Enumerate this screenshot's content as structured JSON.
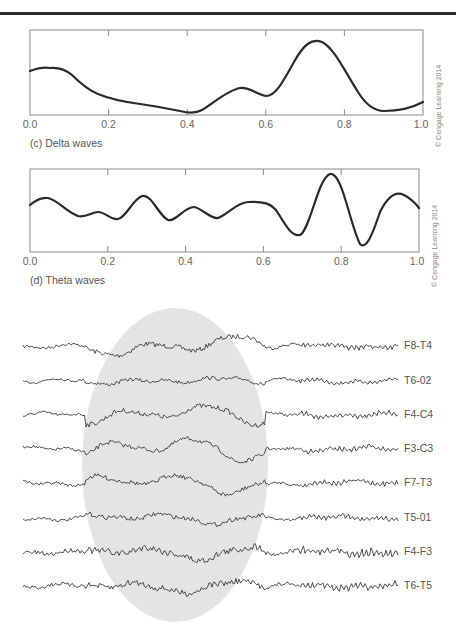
{
  "chart_data": [
    {
      "type": "line",
      "title": "",
      "caption": "(c) Delta waves",
      "xlabel": "",
      "ylabel": "",
      "xlim": [
        0.0,
        1.0
      ],
      "xticks": [
        "0.0",
        "0.2",
        "0.4",
        "0.6",
        "0.8",
        "1.0"
      ],
      "grid": false,
      "credit": "© Cengage Learning 2014",
      "series": [
        {
          "name": "Delta wave",
          "x": [
            0.0,
            0.05,
            0.1,
            0.15,
            0.2,
            0.25,
            0.3,
            0.35,
            0.4,
            0.45,
            0.5,
            0.55,
            0.6,
            0.65,
            0.7,
            0.74,
            0.78,
            0.82,
            0.86,
            0.9,
            0.95,
            1.0
          ],
          "values": [
            0.62,
            0.65,
            0.58,
            0.38,
            0.28,
            0.21,
            0.18,
            0.12,
            0.04,
            0.09,
            0.3,
            0.42,
            0.3,
            0.47,
            0.86,
            0.98,
            0.78,
            0.42,
            0.12,
            0.07,
            0.09,
            0.19
          ]
        }
      ]
    },
    {
      "type": "line",
      "title": "",
      "caption": "(d) Theta waves",
      "xlabel": "",
      "ylabel": "",
      "xlim": [
        0.0,
        1.0
      ],
      "xticks": [
        "0.0",
        "0.2",
        "0.4",
        "0.6",
        "0.8",
        "1.0"
      ],
      "grid": false,
      "credit": "© Cengage Learning 2014",
      "series": [
        {
          "name": "Theta wave",
          "x": [
            0.0,
            0.04,
            0.08,
            0.13,
            0.17,
            0.22,
            0.26,
            0.29,
            0.32,
            0.36,
            0.39,
            0.43,
            0.46,
            0.49,
            0.53,
            0.57,
            0.62,
            0.66,
            0.7,
            0.74,
            0.78,
            0.82,
            0.87,
            0.91,
            0.95,
            1.0
          ],
          "values": [
            0.62,
            0.7,
            0.62,
            0.47,
            0.52,
            0.42,
            0.58,
            0.75,
            0.62,
            0.42,
            0.45,
            0.6,
            0.55,
            0.44,
            0.56,
            0.66,
            0.64,
            0.5,
            0.22,
            0.6,
            1.0,
            0.58,
            0.1,
            0.46,
            0.76,
            0.66
          ]
        }
      ]
    },
    {
      "type": "line",
      "title": "EEG traces",
      "caption": "",
      "highlight": "shaded elliptical region marking synchronized activity across leads",
      "series": [
        {
          "name": "F8-T4"
        },
        {
          "name": "T6-02"
        },
        {
          "name": "F4-C4"
        },
        {
          "name": "F3-C3"
        },
        {
          "name": "F7-T3"
        },
        {
          "name": "T5-01"
        },
        {
          "name": "F4-F3"
        },
        {
          "name": "T6-T5"
        }
      ]
    }
  ],
  "delta": {
    "caption": "(c) Delta waves",
    "credit": "© Cengage Learning 2014",
    "ticks": [
      "0.0",
      "0.2",
      "0.4",
      "0.6",
      "0.8",
      "1.0"
    ]
  },
  "theta": {
    "caption": "(d) Theta waves",
    "credit": "© Cengage Learning 2014",
    "ticks": [
      "0.0",
      "0.2",
      "0.4",
      "0.6",
      "0.8",
      "1.0"
    ]
  },
  "eeg": {
    "leads": [
      "F8-T4",
      "T6-02",
      "F4-C4",
      "F3-C3",
      "F7-T3",
      "T5-01",
      "F4-F3",
      "T6-T5"
    ],
    "highlight_color": "#e4e4e4",
    "trace_color": "#3a3a3a"
  },
  "colors": {
    "curve": "#2a2a2a",
    "axis": "#8a8a8a",
    "rule": "#2b2b2b"
  }
}
